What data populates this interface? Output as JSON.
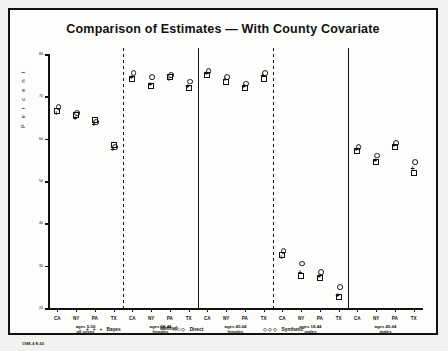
{
  "chart": {
    "title": "Comparison of Estimates  —  With County Covariate",
    "ylabel": "P e r c e n t",
    "method_label": "Method:",
    "footnote": "1988-4 N-65"
  },
  "legend": [
    {
      "name": "bayes",
      "label": "Bayes",
      "symbol": "+ + +"
    },
    {
      "name": "direct",
      "label": "Direct",
      "symbol": "□□◇"
    },
    {
      "name": "synthetic",
      "label": "Synthetic",
      "symbol": "◇◇◇"
    }
  ],
  "chart_data": {
    "type": "scatter",
    "title": "Comparison of Estimates  —  With County Covariate",
    "xlabel": "",
    "ylabel": "Percent",
    "ylim": [
      20,
      80
    ],
    "yticks": [
      20,
      30,
      40,
      50,
      60,
      70,
      80
    ],
    "ytick_labels": [
      "20",
      "30",
      "40",
      "50",
      "60",
      "70",
      "80"
    ],
    "grid": false,
    "legend_position": "bottom",
    "states": [
      "CA",
      "NY",
      "PA",
      "TX"
    ],
    "panels": [
      {
        "group": "ages 5-50\nall sexes",
        "group_line1": "ages 5-50",
        "group_line2": "all sexes",
        "series": [
          {
            "name": "Bayes",
            "values": [
              66.0,
              65.0,
              63.5,
              57.5
            ]
          },
          {
            "name": "Direct",
            "values": [
              66.5,
              65.5,
              64.5,
              58.5
            ]
          },
          {
            "name": "Synthetic",
            "values": [
              67.5,
              66.0,
              64.0,
              58.0
            ]
          }
        ]
      },
      {
        "group": "ages 18-44\nfemales",
        "group_line1": "ages 18-44",
        "group_line2": "females",
        "series": [
          {
            "name": "Bayes",
            "values": [
              74.5,
              73.0,
              74.0,
              72.5
            ]
          },
          {
            "name": "Direct",
            "values": [
              74.0,
              72.5,
              74.5,
              72.0
            ]
          },
          {
            "name": "Synthetic",
            "values": [
              75.5,
              74.5,
              75.0,
              73.5
            ]
          }
        ]
      },
      {
        "group": "ages 45-64\nfemales",
        "group_line1": "ages 45-64",
        "group_line2": "females",
        "series": [
          {
            "name": "Bayes",
            "values": [
              75.5,
              74.0,
              72.5,
              75.0
            ]
          },
          {
            "name": "Direct",
            "values": [
              75.0,
              73.5,
              72.0,
              74.0
            ]
          },
          {
            "name": "Synthetic",
            "values": [
              76.0,
              74.5,
              73.0,
              75.5
            ]
          }
        ]
      },
      {
        "group": "ages 18-44\nmales",
        "group_line1": "ages 18-44",
        "group_line2": "males",
        "series": [
          {
            "name": "Bayes",
            "values": [
              32.0,
              28.5,
              27.5,
              23.0
            ]
          },
          {
            "name": "Direct",
            "values": [
              32.5,
              27.5,
              27.0,
              22.5
            ]
          },
          {
            "name": "Synthetic",
            "values": [
              33.5,
              30.5,
              28.5,
              25.0
            ]
          }
        ]
      },
      {
        "group": "ages 45-64\nmales",
        "group_line1": "ages 45-64",
        "group_line2": "males",
        "series": [
          {
            "name": "Bayes",
            "values": [
              57.5,
              55.0,
              58.5,
              53.0
            ]
          },
          {
            "name": "Direct",
            "values": [
              57.0,
              54.5,
              58.0,
              52.0
            ]
          },
          {
            "name": "Synthetic",
            "values": [
              58.0,
              56.0,
              59.0,
              54.5
            ]
          }
        ]
      }
    ]
  }
}
